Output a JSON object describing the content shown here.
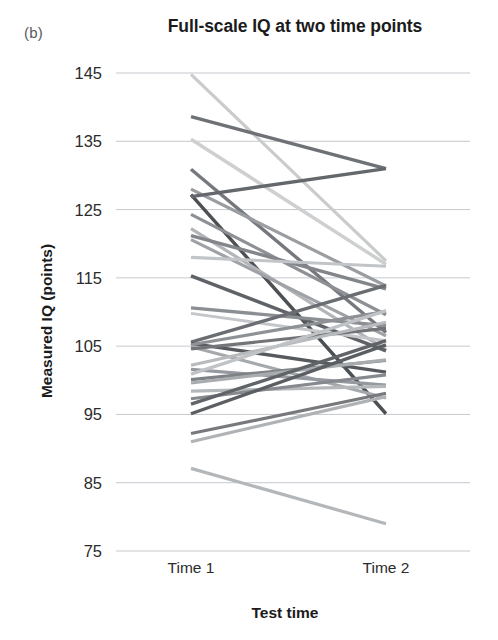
{
  "figure": {
    "panel_label": "(b)",
    "title": "Full-scale IQ at two time points",
    "background_color": "#ffffff",
    "gridline_color": "#c6c9ce",
    "text_color": "#231f20"
  },
  "chart_data": {
    "type": "line",
    "title": "Full-scale IQ at two time points",
    "subtitle": "",
    "xlabel": "Test time",
    "ylabel": "Measured IQ (points)",
    "categories": [
      "Time 1",
      "Time 2"
    ],
    "x": [
      1,
      2
    ],
    "xtick_labels": [
      "Time 1",
      "Time 2"
    ],
    "ytick_labels": [
      "75",
      "85",
      "95",
      "105",
      "115",
      "125",
      "135",
      "145"
    ],
    "yticks": [
      75,
      85,
      95,
      105,
      115,
      125,
      135,
      145
    ],
    "ylim": [
      75,
      147
    ],
    "grid": "horizontal",
    "legend": "none",
    "annotations": [
      "(b)"
    ],
    "note": "Spaghetti plot: each line is one participant measured at two time points",
    "n_series": 32,
    "series": [
      {
        "name": "p01",
        "values": [
          144.8,
          117.5
        ],
        "color": "#c9cbcd",
        "width": 3.2
      },
      {
        "name": "p02",
        "values": [
          138.6,
          131.0
        ],
        "color": "#6e7277",
        "width": 3.4
      },
      {
        "name": "p03",
        "values": [
          135.3,
          117.0
        ],
        "color": "#cdcfd1",
        "width": 3.4
      },
      {
        "name": "p04",
        "values": [
          130.9,
          107.0
        ],
        "color": "#75797e",
        "width": 3.4
      },
      {
        "name": "p05",
        "values": [
          128.0,
          113.8
        ],
        "color": "#9a9da1",
        "width": 3.2
      },
      {
        "name": "p06",
        "values": [
          127.2,
          95.1
        ],
        "color": "#4d5053",
        "width": 3.4
      },
      {
        "name": "p07",
        "values": [
          126.9,
          131.0
        ],
        "color": "#64686c",
        "width": 3.4
      },
      {
        "name": "p08",
        "values": [
          124.3,
          109.6
        ],
        "color": "#8d9094",
        "width": 3.2
      },
      {
        "name": "p09",
        "values": [
          122.2,
          104.5
        ],
        "color": "#b3b6b9",
        "width": 3.2
      },
      {
        "name": "p10",
        "values": [
          121.2,
          113.4
        ],
        "color": "#82868a",
        "width": 3.4
      },
      {
        "name": "p11",
        "values": [
          120.6,
          106.5
        ],
        "color": "#9fa2a6",
        "width": 3.2
      },
      {
        "name": "p12",
        "values": [
          118.0,
          116.7
        ],
        "color": "#c2c5c8",
        "width": 3.2
      },
      {
        "name": "p13",
        "values": [
          115.3,
          104.3
        ],
        "color": "#5f6367",
        "width": 3.4
      },
      {
        "name": "p14",
        "values": [
          110.6,
          108.0
        ],
        "color": "#8b8e92",
        "width": 3.4
      },
      {
        "name": "p15",
        "values": [
          109.8,
          105.8
        ],
        "color": "#c4c7ca",
        "width": 3.0
      },
      {
        "name": "p16",
        "values": [
          105.6,
          113.9
        ],
        "color": "#6a6e72",
        "width": 3.4
      },
      {
        "name": "p17",
        "values": [
          105.4,
          101.2
        ],
        "color": "#565a5e",
        "width": 3.4
      },
      {
        "name": "p18",
        "values": [
          105.2,
          110.1
        ],
        "color": "#8e9195",
        "width": 3.2
      },
      {
        "name": "p19",
        "values": [
          104.9,
          97.4
        ],
        "color": "#a5a8ac",
        "width": 3.2
      },
      {
        "name": "p20",
        "values": [
          104.6,
          107.6
        ],
        "color": "#737478",
        "width": 3.2
      },
      {
        "name": "p21",
        "values": [
          102.2,
          108.5
        ],
        "color": "#b8bbbe",
        "width": 3.2
      },
      {
        "name": "p22",
        "values": [
          101.6,
          99.3
        ],
        "color": "#9599a0",
        "width": 3.2
      },
      {
        "name": "p23",
        "values": [
          100.9,
          110.2
        ],
        "color": "#c0c3c6",
        "width": 3.2
      },
      {
        "name": "p24",
        "values": [
          100.1,
          102.9
        ],
        "color": "#7e8185",
        "width": 3.2
      },
      {
        "name": "p25",
        "values": [
          99.6,
          103.0
        ],
        "color": "#a9acaf",
        "width": 3.2
      },
      {
        "name": "p26",
        "values": [
          98.4,
          99.1
        ],
        "color": "#b5b8bb",
        "width": 3.2
      },
      {
        "name": "p27",
        "values": [
          97.3,
          100.8
        ],
        "color": "#868a8e",
        "width": 3.2
      },
      {
        "name": "p28",
        "values": [
          96.5,
          105.8
        ],
        "color": "#606468",
        "width": 3.4
      },
      {
        "name": "p29",
        "values": [
          95.1,
          105.2
        ],
        "color": "#5b5f63",
        "width": 3.4
      },
      {
        "name": "p30",
        "values": [
          92.2,
          98.1
        ],
        "color": "#77797d",
        "width": 3.2
      },
      {
        "name": "p31",
        "values": [
          91.0,
          97.6
        ],
        "color": "#b0b3b6",
        "width": 3.2
      },
      {
        "name": "p32",
        "values": [
          87.1,
          79.0
        ],
        "color": "#b4b7ba",
        "width": 3.2
      }
    ]
  }
}
